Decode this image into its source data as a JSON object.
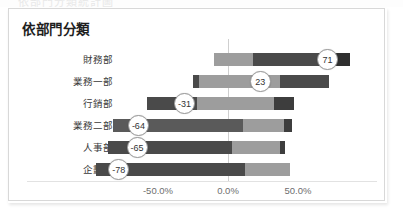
{
  "window": {
    "ghost_text_above": "依部門分類統計圖"
  },
  "panel": {
    "title": "依部門分類"
  },
  "chart_data": {
    "type": "bar",
    "orientation": "horizontal",
    "subtype": "diverging-stacked",
    "title": "依部門分類",
    "xlabel": "",
    "ylabel": "",
    "xlim": [
      -100,
      100
    ],
    "grid": false,
    "zero_axis": true,
    "legend": "none",
    "tick_labels": [
      "-50.0%",
      "0.0%",
      "50.0%"
    ],
    "tick_values": [
      -50,
      0,
      50
    ],
    "categories": [
      "財務部",
      "業務一部",
      "行銷部",
      "業務二部",
      "人事部",
      "企劃部"
    ],
    "values": [
      71,
      23,
      -31,
      -64,
      -65,
      -78
    ],
    "data_labels": [
      "71",
      "23",
      "-31",
      "-64",
      "-65",
      "-78"
    ],
    "bars": [
      {
        "category": "財務部",
        "label": "71",
        "label_pos": 71,
        "segments": [
          {
            "start": -10,
            "end": 18,
            "color": "#9d9d9d"
          },
          {
            "start": 18,
            "end": 78,
            "color": "#4a4a4a"
          },
          {
            "start": 78,
            "end": 87,
            "color": "#2f2f2f"
          }
        ]
      },
      {
        "category": "業務一部",
        "label": "23",
        "label_pos": 23,
        "segments": [
          {
            "start": -25,
            "end": -21,
            "color": "#4a4a4a"
          },
          {
            "start": -21,
            "end": 37,
            "color": "#9d9d9d"
          },
          {
            "start": 37,
            "end": 72,
            "color": "#4a4a4a"
          }
        ]
      },
      {
        "category": "行銷部",
        "label": "-31",
        "label_pos": -31,
        "segments": [
          {
            "start": -58,
            "end": -22,
            "color": "#4a4a4a"
          },
          {
            "start": -22,
            "end": 33,
            "color": "#9d9d9d"
          },
          {
            "start": 33,
            "end": 47,
            "color": "#3d3d3d"
          }
        ]
      },
      {
        "category": "業務二部",
        "label": "-64",
        "label_pos": -64,
        "segments": [
          {
            "start": -82,
            "end": 11,
            "color": "#5a5a5a"
          },
          {
            "start": 11,
            "end": 40,
            "color": "#9d9d9d"
          },
          {
            "start": 40,
            "end": 46,
            "color": "#3d3d3d"
          }
        ]
      },
      {
        "category": "人事部",
        "label": "-65",
        "label_pos": -65,
        "segments": [
          {
            "start": -86,
            "end": 3,
            "color": "#4a4a4a"
          },
          {
            "start": 3,
            "end": 37,
            "color": "#9d9d9d"
          },
          {
            "start": 37,
            "end": 41,
            "color": "#3d3d3d"
          }
        ]
      },
      {
        "category": "企劃部",
        "label": "-78",
        "label_pos": -78,
        "segments": [
          {
            "start": -94,
            "end": 12,
            "color": "#4a4a4a"
          },
          {
            "start": 12,
            "end": 44,
            "color": "#9d9d9d"
          }
        ]
      }
    ],
    "colors": {
      "light_gray": "#9d9d9d",
      "mid_gray": "#5a5a5a",
      "dark_gray": "#4a4a4a",
      "darkest_gray": "#2f2f2f",
      "zero_line": "#cfcfcf",
      "bubble_fill": "#ffffff",
      "bubble_border": "#9a9a9a",
      "tick_text": "#6e6e6e",
      "title_text": "#1f1f1f",
      "panel_border": "#d8d8d8",
      "background": "#ffffff"
    }
  }
}
